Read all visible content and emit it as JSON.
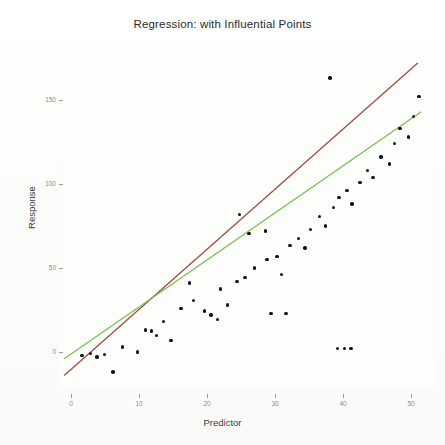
{
  "chart_data": {
    "type": "scatter",
    "title": "Regression: with Influential Points",
    "xlabel": "Predictor",
    "ylabel": "Response",
    "xlim": [
      -2,
      54
    ],
    "ylim": [
      -18,
      175
    ],
    "grid": false,
    "legend": "none",
    "x_ticks": [
      0,
      10,
      20,
      30,
      40,
      50
    ],
    "x_tick_labels": [
      "0",
      "10",
      "20",
      "30",
      "40",
      "50"
    ],
    "y_ticks": [
      0,
      50,
      100,
      150
    ],
    "y_tick_labels": [
      "0",
      "50",
      "100",
      "150"
    ],
    "points": [
      [
        1.6,
        -2.0
      ],
      [
        2.9,
        -1.0
      ],
      [
        3.8,
        -3.0
      ],
      [
        4.9,
        -1.5
      ],
      [
        7.6,
        3.0
      ],
      [
        9.8,
        0.0
      ],
      [
        6.2,
        -12.0
      ],
      [
        11.0,
        13.0
      ],
      [
        11.8,
        12.5
      ],
      [
        13.6,
        18.0
      ],
      [
        14.7,
        7.0
      ],
      [
        16.2,
        26.0
      ],
      [
        18.0,
        30.5
      ],
      [
        19.6,
        24.5
      ],
      [
        20.6,
        22.0
      ],
      [
        21.5,
        19.5
      ],
      [
        23.0,
        28.0
      ],
      [
        24.4,
        42.0
      ],
      [
        25.6,
        44.5
      ],
      [
        27.0,
        50.0
      ],
      [
        28.8,
        55.0
      ],
      [
        30.3,
        57.0
      ],
      [
        31.0,
        46.0
      ],
      [
        32.2,
        63.5
      ],
      [
        33.5,
        67.5
      ],
      [
        34.4,
        62.0
      ],
      [
        35.2,
        73.0
      ],
      [
        36.5,
        80.5
      ],
      [
        37.4,
        75.0
      ],
      [
        38.6,
        86.0
      ],
      [
        39.4,
        92.0
      ],
      [
        40.6,
        96.0
      ],
      [
        41.3,
        88.0
      ],
      [
        42.5,
        101.0
      ],
      [
        43.6,
        108.0
      ],
      [
        44.4,
        104.0
      ],
      [
        45.6,
        116.0
      ],
      [
        46.8,
        112.0
      ],
      [
        47.6,
        124.0
      ],
      [
        48.4,
        133.0
      ],
      [
        49.6,
        128.0
      ],
      [
        50.4,
        140.0
      ],
      [
        51.2,
        152.0
      ],
      [
        38.1,
        163.0
      ],
      [
        28.6,
        72.0
      ],
      [
        26.2,
        70.5
      ],
      [
        24.8,
        82.0
      ],
      [
        22.0,
        37.5
      ],
      [
        17.4,
        41.0
      ],
      [
        12.6,
        10.0
      ],
      [
        39.2,
        2.0
      ],
      [
        40.2,
        2.0
      ],
      [
        41.2,
        2.0
      ],
      [
        29.4,
        23.0
      ],
      [
        31.6,
        23.0
      ]
    ],
    "lines": [
      {
        "name": "ols-with-influential",
        "color": "#a34a42",
        "x_start": -1.0,
        "y_start": -14.0,
        "x_end": 51.0,
        "y_end": 172.0
      },
      {
        "name": "ols-robust",
        "color": "#72c14e",
        "x_start": -1.0,
        "y_start": -4.0,
        "x_end": 51.5,
        "y_end": 143.0
      }
    ]
  },
  "axis": {
    "x_label": "Predictor",
    "y_label": "Response"
  }
}
